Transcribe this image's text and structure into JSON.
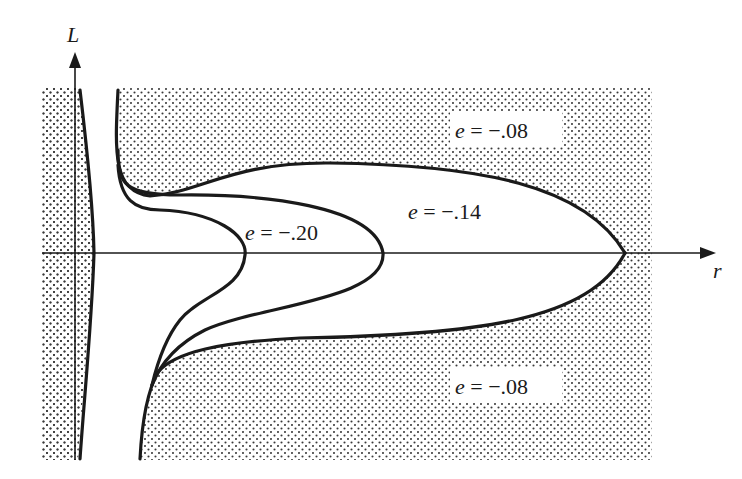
{
  "figure": {
    "axes": {
      "vertical_label": "L",
      "horizontal_label": "r"
    },
    "labels": {
      "top_region": {
        "var": "e",
        "eq": " = ",
        "value": "−.08"
      },
      "middle_region": {
        "var": "e",
        "eq": " = ",
        "value": "−.14"
      },
      "inner_region": {
        "var": "e",
        "eq": " = ",
        "value": "−.20"
      },
      "bottom_region": {
        "var": "e",
        "eq": " = ",
        "value": "−.08"
      }
    },
    "colors": {
      "ink": "#1a1a1a",
      "stipple": "#3a3a3a",
      "background": "#ffffff"
    }
  }
}
